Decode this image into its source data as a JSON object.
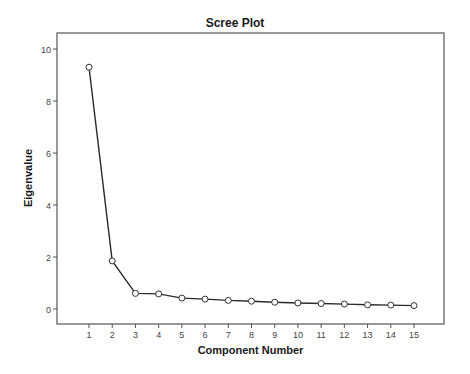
{
  "chart_data": {
    "type": "line",
    "title": "Scree Plot",
    "xlabel": "Component Number",
    "ylabel": "Eigenvalue",
    "x": [
      1,
      2,
      3,
      4,
      5,
      6,
      7,
      8,
      9,
      10,
      11,
      12,
      13,
      14,
      15
    ],
    "categories": [
      "1",
      "2",
      "3",
      "4",
      "5",
      "6",
      "7",
      "8",
      "9",
      "10",
      "11",
      "12",
      "13",
      "14",
      "15"
    ],
    "series": [
      {
        "name": "Eigenvalue",
        "values": [
          9.3,
          1.85,
          0.6,
          0.58,
          0.42,
          0.38,
          0.33,
          0.3,
          0.26,
          0.23,
          0.21,
          0.19,
          0.16,
          0.15,
          0.13
        ]
      }
    ],
    "yticks": [
      0,
      2,
      4,
      6,
      8,
      10
    ],
    "ylim": [
      -0.6,
      10.7
    ],
    "xlim": [
      0,
      16.4
    ],
    "grid": false,
    "legend": "none",
    "marker": "open-circle",
    "line_color": "#2b2b2b"
  }
}
